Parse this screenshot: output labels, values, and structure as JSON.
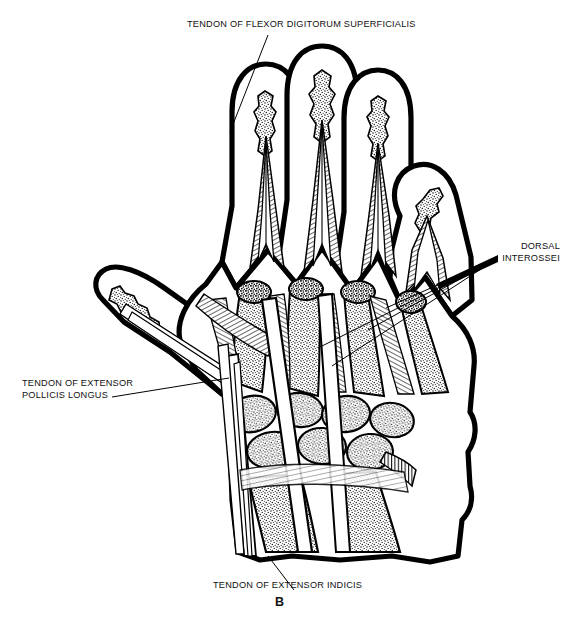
{
  "figure": {
    "panel_letter": "B",
    "background_color": "#ffffff",
    "ink_color": "#000000"
  },
  "labels": {
    "flexor_digitorum_superficialis": "TENDON OF FLEXOR DIGITORUM SUPERFICIALIS",
    "dorsal_interossei_line1": "DORSAL",
    "dorsal_interossei_line2": "INTEROSSEI",
    "extensor_pollicis_longus_line1": "TENDON OF EXTENSOR",
    "extensor_pollicis_longus_line2": "POLLICIS LONGUS",
    "extensor_indicis": "TENDON OF EXTENSOR INDICIS"
  }
}
